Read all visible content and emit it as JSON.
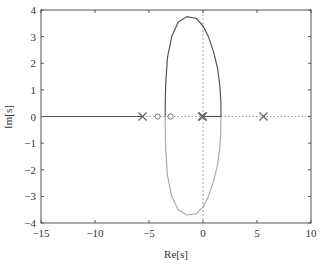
{
  "chart_data": {
    "type": "line",
    "title": "",
    "subtitle": "Root locus",
    "xlabel": "Re[s]",
    "ylabel": "Im[s]",
    "xlim": [
      -15,
      10
    ],
    "ylim": [
      -4,
      4
    ],
    "xticks": [
      -15,
      -10,
      -5,
      0,
      5,
      10
    ],
    "yticks": [
      -4,
      -3,
      -2,
      -1,
      0,
      1,
      2,
      3,
      4
    ],
    "xtick_labels": [
      "−15",
      "−10",
      "−5",
      "0",
      "5",
      "10"
    ],
    "ytick_labels": [
      "−4",
      "−3",
      "−2",
      "−1",
      "0",
      "1",
      "2",
      "3",
      "4"
    ],
    "grid": false,
    "legend": null,
    "poles": [
      {
        "re": -5.6,
        "im": 0
      },
      {
        "re": -0.1,
        "im": 0
      },
      {
        "re": 0.0,
        "im": 0
      },
      {
        "re": 5.6,
        "im": 0
      }
    ],
    "zeros": [
      {
        "re": -4.2,
        "im": 0
      },
      {
        "re": -3.0,
        "im": 0
      }
    ],
    "series": [
      {
        "name": "upper-branch",
        "color": "#555555",
        "points": [
          [
            1.67,
            0
          ],
          [
            1.65,
            0.6
          ],
          [
            1.55,
            1.2
          ],
          [
            1.35,
            1.8
          ],
          [
            1.0,
            2.4
          ],
          [
            0.5,
            3.0
          ],
          [
            0.0,
            3.4
          ],
          [
            -0.6,
            3.68
          ],
          [
            -1.5,
            3.75
          ],
          [
            -2.3,
            3.55
          ],
          [
            -2.9,
            3.0
          ],
          [
            -3.3,
            2.2
          ],
          [
            -3.45,
            1.2
          ],
          [
            -3.5,
            0.4
          ],
          [
            -3.5,
            0
          ]
        ]
      },
      {
        "name": "lower-branch",
        "color": "#aaaaaa",
        "points": [
          [
            1.67,
            0
          ],
          [
            1.65,
            -0.6
          ],
          [
            1.55,
            -1.2
          ],
          [
            1.35,
            -1.8
          ],
          [
            1.0,
            -2.4
          ],
          [
            0.5,
            -3.0
          ],
          [
            0.0,
            -3.4
          ],
          [
            -0.6,
            -3.65
          ],
          [
            -1.5,
            -3.7
          ],
          [
            -2.3,
            -3.5
          ],
          [
            -2.9,
            -3.0
          ],
          [
            -3.3,
            -2.2
          ],
          [
            -3.45,
            -1.2
          ],
          [
            -3.5,
            -0.4
          ],
          [
            -3.5,
            0
          ]
        ]
      },
      {
        "name": "real-axis-left",
        "color": "#555555",
        "points": [
          [
            -15,
            0
          ],
          [
            -5.6,
            0
          ]
        ]
      },
      {
        "name": "real-axis-right",
        "color": "#555555",
        "points": [
          [
            0,
            0
          ],
          [
            1.67,
            0
          ]
        ]
      }
    ],
    "dotted_segments": [
      {
        "from": -5.6,
        "to": 0
      },
      {
        "from": 1.67,
        "to": 10
      }
    ],
    "imag_axis_dashed": true
  }
}
